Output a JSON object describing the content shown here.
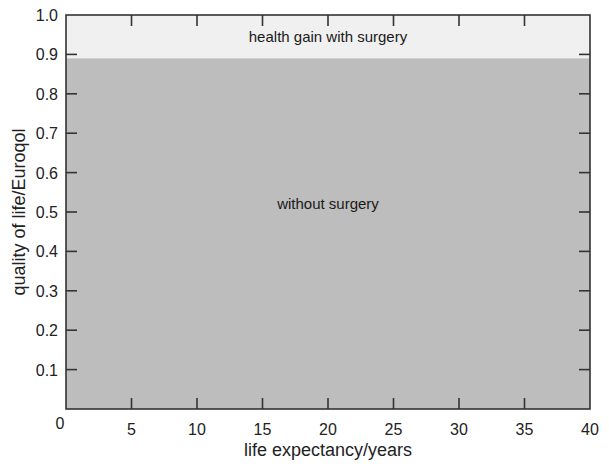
{
  "chart_data": {
    "type": "area",
    "title": "",
    "xlabel": "life expectancy/years",
    "ylabel": "quality of life/Euroqol",
    "xlim": [
      0,
      40
    ],
    "ylim": [
      0,
      1.0
    ],
    "x_ticks": [
      0,
      5,
      10,
      15,
      20,
      25,
      30,
      35,
      40
    ],
    "x_tick_labels": [
      "0",
      "5",
      "10",
      "15",
      "20",
      "25",
      "30",
      "35",
      "40"
    ],
    "y_ticks": [
      0.1,
      0.2,
      0.3,
      0.4,
      0.5,
      0.6,
      0.7,
      0.8,
      0.9,
      1.0
    ],
    "y_tick_labels": [
      "0.1",
      "0.2",
      "0.3",
      "0.4",
      "0.5",
      "0.6",
      "0.7",
      "0.8",
      "0.9",
      "1.0"
    ],
    "grid": false,
    "legend": null,
    "series": [
      {
        "name": "without surgery",
        "x": [
          0,
          40
        ],
        "values": [
          0.89,
          0.89
        ],
        "color": "#bdbdbd"
      },
      {
        "name": "health gain with surgery",
        "x": [
          0,
          40
        ],
        "values_from": 0.89,
        "values_to": 1.0,
        "color": "#f0f0f0"
      }
    ],
    "annotations": [
      {
        "text": "health gain with surgery",
        "x": 20,
        "y": 0.945
      },
      {
        "text": "without surgery",
        "x": 20,
        "y": 0.52
      }
    ]
  }
}
